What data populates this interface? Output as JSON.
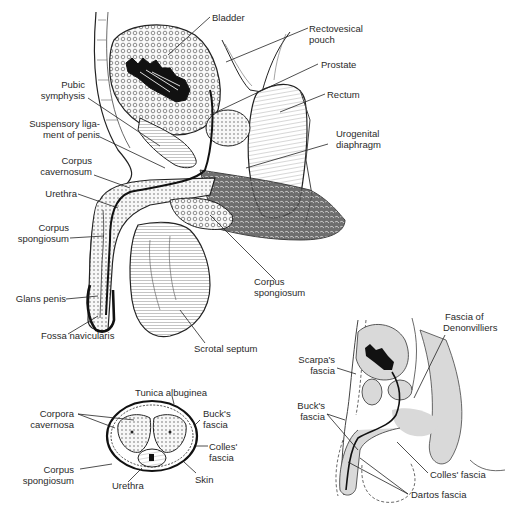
{
  "figures": {
    "sagittal_section": {
      "labels": {
        "bladder": "Bladder",
        "rectovesical_pouch_1": "Rectovesical",
        "rectovesical_pouch_2": "pouch",
        "prostate": "Prostate",
        "rectum": "Rectum",
        "urogenital_diaphragm_1": "Urogenital",
        "urogenital_diaphragm_2": "diaphragm",
        "pubic_symphysis_1": "Pubic",
        "pubic_symphysis_2": "symphysis",
        "suspensory_ligament_1": "Suspensory liga-",
        "suspensory_ligament_2": "ment of penis",
        "corpus_cavernosum_1": "Corpus",
        "corpus_cavernosum_2": "cavernosum",
        "urethra": "Urethra",
        "corpus_spongiosum_left_1": "Corpus",
        "corpus_spongiosum_left_2": "spongiosum",
        "corpus_spongiosum_right_1": "Corpus",
        "corpus_spongiosum_right_2": "spongiosum",
        "glans_penis": "Glans penis",
        "fossa_navicularis": "Fossa navicularis",
        "scrotal_septum": "Scrotal septum"
      }
    },
    "cross_section": {
      "labels": {
        "tunica_albuginea": "Tunica albuginea",
        "corpora_cavernosa_1": "Corpora",
        "corpora_cavernosa_2": "cavernosa",
        "bucks_fascia_1": "Buck's",
        "bucks_fascia_2": "fascia",
        "colles_fascia_1": "Colles'",
        "colles_fascia_2": "fascia",
        "corpus_spongiosum_1": "Corpus",
        "corpus_spongiosum_2": "spongiosum",
        "urethra": "Urethra",
        "skin": "Skin"
      }
    },
    "fascia_diagram": {
      "labels": {
        "fascia_denonvilliers_1": "Fascia of",
        "fascia_denonvilliers_2": "Denonvilliers",
        "scarpas_fascia_1": "Scarpa's",
        "scarpas_fascia_2": "fascia",
        "bucks_fascia_1": "Buck's",
        "bucks_fascia_2": "fascia",
        "colles_fascia": "Colles' fascia",
        "dartos_fascia": "Dartos fascia"
      }
    }
  },
  "colors": {
    "ink": "#1a1a1a",
    "tissue_fill": "#f4f4f0",
    "tint_gray": "#d9d9d9",
    "label_text": "#2a2a2a"
  }
}
